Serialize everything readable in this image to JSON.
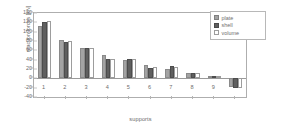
{
  "chart_data": {
    "type": "bar",
    "title": "",
    "xlabel": "supports",
    "ylabel": "reaction forces [kN]",
    "categories": [
      "1",
      "2",
      "3",
      "4",
      "5",
      "6",
      "7",
      "8",
      "9",
      ""
    ],
    "series": [
      {
        "name": "plate",
        "color": "#a3a3a3",
        "values": [
          113,
          82,
          64,
          51,
          39,
          28,
          21,
          11,
          4,
          -18
        ]
      },
      {
        "name": "shell",
        "color": "#5f5f5f",
        "values": [
          121,
          78,
          64,
          41,
          42,
          23,
          26,
          11,
          4,
          -20
        ]
      },
      {
        "name": "volume",
        "color": "#ffffff",
        "values": [
          122,
          80,
          64,
          42,
          42,
          24,
          24,
          11,
          4,
          -20
        ]
      }
    ],
    "ylim": [
      -40,
      140
    ],
    "yticks": [
      "140",
      "120",
      "100",
      "80",
      "60",
      "40",
      "20",
      "0",
      "-20",
      "-40"
    ],
    "ytick_values": [
      140,
      120,
      100,
      80,
      60,
      40,
      20,
      0,
      -20,
      -40
    ],
    "grid": false,
    "legend_position": "top-right",
    "legend_entries": [
      "plate",
      "shell",
      "volume"
    ]
  },
  "legend": {
    "items": [
      {
        "label": "plate"
      },
      {
        "label": "shell"
      },
      {
        "label": "volume"
      }
    ]
  },
  "axes": {
    "y_title": "reaction forces [kN]",
    "x_title": "supports"
  }
}
